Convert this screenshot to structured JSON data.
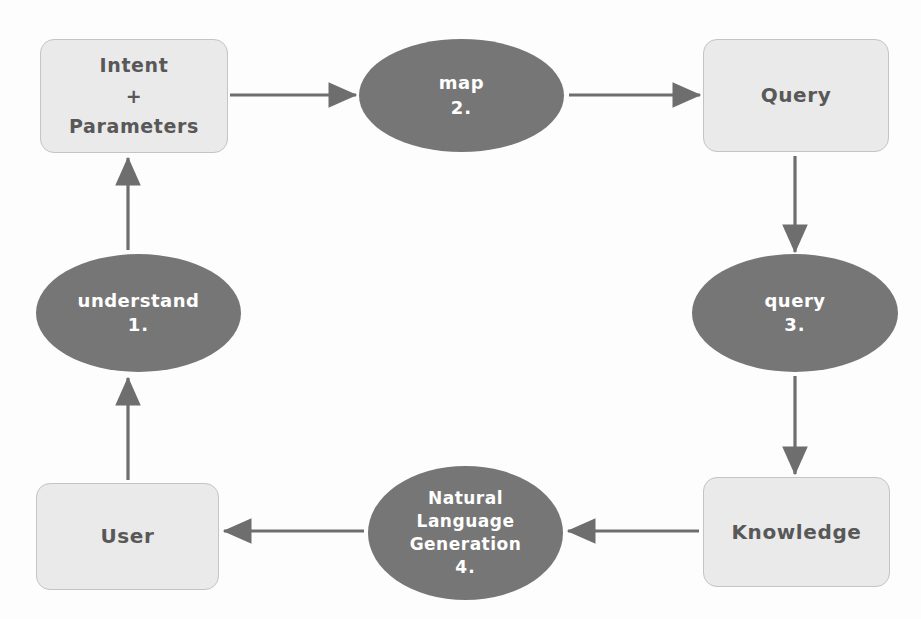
{
  "diagram": {
    "type": "cycle-flowchart",
    "background_color": "#fdfdfd",
    "box_fill_color": "#eaeaea",
    "box_border_color": "#c4c4c4",
    "box_text_color": "#585858",
    "ellipse_fill_color": "#767676",
    "ellipse_text_color": "#ffffff",
    "arrow_color": "#6e6e6e"
  },
  "nodes": {
    "intent": {
      "shape": "rounded-rectangle",
      "line1": "Intent",
      "line2": "+",
      "line3": "Parameters"
    },
    "map": {
      "shape": "ellipse",
      "label": "map",
      "number": "2."
    },
    "query_box": {
      "shape": "rounded-rectangle",
      "label": "Query"
    },
    "understand": {
      "shape": "ellipse",
      "label": "understand",
      "number": "1."
    },
    "query_ellipse": {
      "shape": "ellipse",
      "label": "query",
      "number": "3."
    },
    "user": {
      "shape": "rounded-rectangle",
      "label": "User"
    },
    "nlg": {
      "shape": "ellipse",
      "line1": "Natural",
      "line2": "Language",
      "line3": "Generation",
      "number": "4."
    },
    "knowledge": {
      "shape": "rounded-rectangle",
      "label": "Knowledge"
    }
  },
  "edges": [
    {
      "id": "intent-to-map",
      "from": "intent",
      "to": "map",
      "direction": "right"
    },
    {
      "id": "map-to-query-box",
      "from": "map",
      "to": "query_box",
      "direction": "right"
    },
    {
      "id": "query-box-to-query",
      "from": "query_box",
      "to": "query_ellipse",
      "direction": "down"
    },
    {
      "id": "query-to-knowledge",
      "from": "query_ellipse",
      "to": "knowledge",
      "direction": "down"
    },
    {
      "id": "knowledge-to-nlg",
      "from": "knowledge",
      "to": "nlg",
      "direction": "left"
    },
    {
      "id": "nlg-to-user",
      "from": "nlg",
      "to": "user",
      "direction": "left"
    },
    {
      "id": "user-to-understand",
      "from": "user",
      "to": "understand",
      "direction": "up"
    },
    {
      "id": "understand-to-intent",
      "from": "understand",
      "to": "intent",
      "direction": "up"
    }
  ]
}
